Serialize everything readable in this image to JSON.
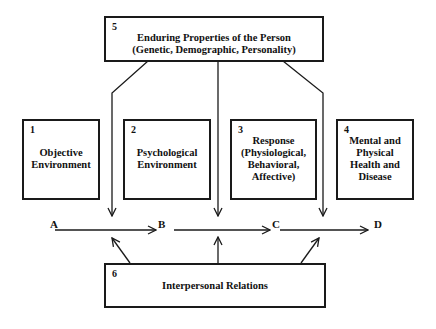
{
  "boxes": [
    {
      "number": "1",
      "lines": [
        "Objective",
        "Environment"
      ]
    },
    {
      "number": "2",
      "lines": [
        "Psychological",
        "Environment"
      ]
    },
    {
      "number": "3",
      "lines": [
        "Response",
        "(Physiological,",
        "Behavioral,",
        "Affective)"
      ]
    },
    {
      "number": "4",
      "lines": [
        "Mental and",
        "Physical",
        "Health and",
        "Disease"
      ]
    },
    {
      "number": "5",
      "lines": [
        "Enduring Properties of the Person",
        "(Genetic, Demographic, Personality)"
      ]
    },
    {
      "number": "6",
      "lines": [
        "Interpersonal Relations"
      ]
    }
  ],
  "nodes": [
    "A",
    "B",
    "C",
    "D"
  ]
}
